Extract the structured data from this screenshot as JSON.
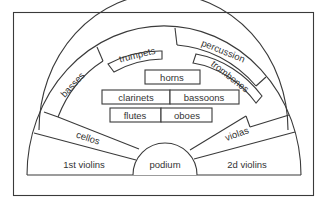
{
  "diagram": {
    "sections": {
      "first_violins": "1st violins",
      "second_violins": "2d violins",
      "cellos": "cellos",
      "violas": "violas",
      "podium": "podium",
      "basses": "basses",
      "trumpets": "trumpets",
      "percussion": "percussion",
      "trombones": "trombones",
      "horns": "horns",
      "clarinets": "clarinets",
      "bassoons": "bassoons",
      "flutes": "flutes",
      "oboes": "oboes"
    },
    "colors": {
      "line": "#3a3a3a",
      "text": "#333333",
      "background": "#ffffff"
    }
  }
}
